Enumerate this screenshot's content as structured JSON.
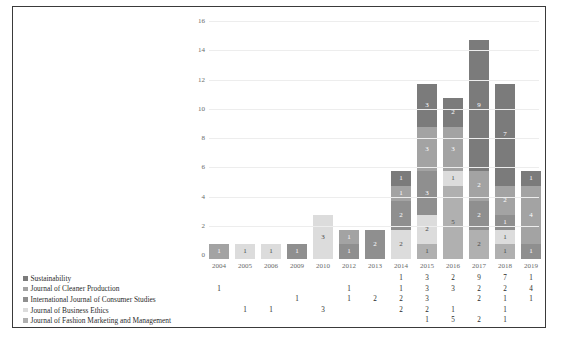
{
  "chart_data": {
    "type": "bar",
    "subtype": "stacked-bar-with-data-table",
    "title": "",
    "xlabel": "",
    "ylabel": "",
    "ylim": [
      0,
      16
    ],
    "yticks": [
      0,
      2,
      4,
      6,
      8,
      10,
      12,
      14,
      16
    ],
    "grid": true,
    "legend_position": "bottom-left",
    "data_labels": true,
    "categories": [
      "2004",
      "2005",
      "2006",
      "2009",
      "2010",
      "2012",
      "2013",
      "2014",
      "2015",
      "2016",
      "2017",
      "2018",
      "2019"
    ],
    "series": [
      {
        "name": "Sustainability",
        "color": "#7b7b7b",
        "values": [
          0,
          0,
          0,
          0,
          0,
          0,
          0,
          1,
          3,
          2,
          9,
          7,
          1
        ]
      },
      {
        "name": "Journal of Cleaner Production",
        "color": "#a3a3a3",
        "values": [
          1,
          0,
          0,
          0,
          0,
          1,
          0,
          1,
          3,
          3,
          2,
          2,
          4
        ]
      },
      {
        "name": "International Journal of Consumer Studies",
        "color": "#8f8f8f",
        "values": [
          0,
          0,
          0,
          1,
          0,
          1,
          2,
          2,
          3,
          0,
          2,
          1,
          1
        ]
      },
      {
        "name": "Journal of Business Ethics",
        "color": "#dcdcdc",
        "values": [
          0,
          1,
          1,
          0,
          3,
          0,
          0,
          2,
          2,
          1,
          0,
          1,
          0
        ]
      },
      {
        "name": "Journal of Fashion Marketing and Management",
        "color": "#b0b0b0",
        "values": [
          0,
          0,
          0,
          0,
          0,
          0,
          0,
          0,
          1,
          5,
          2,
          1,
          0
        ]
      }
    ],
    "totals": [
      1,
      1,
      1,
      1,
      3,
      2,
      2,
      6,
      12,
      11,
      15,
      12,
      6
    ]
  },
  "axis": {
    "ytick_labels": [
      "16",
      "14",
      "12",
      "10",
      "8",
      "6",
      "4",
      "2",
      "0"
    ]
  },
  "table": {
    "column_headers": [
      "2004",
      "2005",
      "2006",
      "2009",
      "2010",
      "2012",
      "2013",
      "2014",
      "2015",
      "2016",
      "2017",
      "2018",
      "2019"
    ],
    "rows": [
      {
        "label": "Sustainability",
        "swatch_color": "#7b7b7b",
        "cells": [
          "",
          "",
          "",
          "",
          "",
          "",
          "",
          "1",
          "3",
          "2",
          "9",
          "7",
          "1"
        ]
      },
      {
        "label": "Journal of Cleaner Production",
        "swatch_color": "#a3a3a3",
        "cells": [
          "1",
          "",
          "",
          "",
          "",
          "1",
          "",
          "1",
          "3",
          "3",
          "2",
          "2",
          "4"
        ]
      },
      {
        "label": "International Journal of Consumer Studies",
        "swatch_color": "#8f8f8f",
        "cells": [
          "",
          "",
          "",
          "1",
          "",
          "1",
          "2",
          "2",
          "3",
          "",
          "2",
          "1",
          "1"
        ]
      },
      {
        "label": "Journal of Business Ethics",
        "swatch_color": "#dcdcdc",
        "cells": [
          "",
          "1",
          "1",
          "",
          "3",
          "",
          "",
          "2",
          "2",
          "1",
          "",
          "1",
          ""
        ]
      },
      {
        "label": "Journal of Fashion Marketing and Management",
        "swatch_color": "#b0b0b0",
        "cells": [
          "",
          "",
          "",
          "",
          "",
          "",
          "",
          "",
          "1",
          "5",
          "2",
          "1",
          ""
        ]
      }
    ]
  }
}
